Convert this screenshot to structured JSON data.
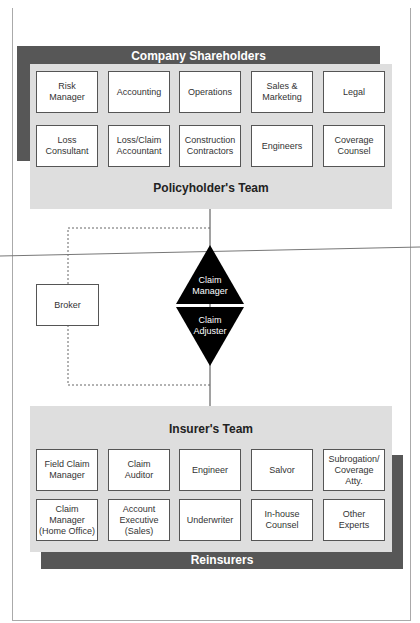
{
  "policyholder": {
    "outer_label": "Company Shareholders",
    "team_label": "Policyholder's Team",
    "boxes": [
      "Risk\nManager",
      "Accounting",
      "Operations",
      "Sales &\nMarketing",
      "Legal",
      "Loss\nConsultant",
      "Loss/Claim\nAccountant",
      "Construction\nContractors",
      "Engineers",
      "Coverage\nCounsel"
    ]
  },
  "center": {
    "broker": "Broker",
    "claim_manager": "Claim\nManager",
    "claim_adjuster": "Claim\nAdjuster"
  },
  "insurer": {
    "team_label": "Insurer's Team",
    "outer_label": "Reinsurers",
    "boxes": [
      "Field Claim\nManager",
      "Claim\nAuditor",
      "Engineer",
      "Salvor",
      "Subrogation/\nCoverage Atty.",
      "Claim Manager\n(Home Office)",
      "Account Executive\n(Sales)",
      "Underwriter",
      "In-house\nCounsel",
      "Other\nExperts"
    ]
  },
  "colors": {
    "dark_band": "#575757",
    "panel": "#dedede",
    "diamond": "#000000"
  }
}
